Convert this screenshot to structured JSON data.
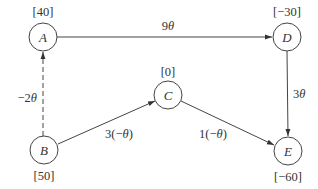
{
  "diagram": {
    "type": "directed-graph",
    "colors": {
      "stroke": "#444444",
      "text": "#333333",
      "background": "#ffffff"
    },
    "nodes": [
      {
        "id": "A",
        "label": "A",
        "value": "[40]",
        "cx": 43,
        "cy": 37,
        "value_pos": "above"
      },
      {
        "id": "D",
        "label": "D",
        "value": "[−30]",
        "cx": 287,
        "cy": 37,
        "value_pos": "above"
      },
      {
        "id": "C",
        "label": "C",
        "value": "[0]",
        "cx": 168,
        "cy": 95,
        "value_pos": "above"
      },
      {
        "id": "B",
        "label": "B",
        "value": "[50]",
        "cx": 44,
        "cy": 150,
        "value_pos": "below"
      },
      {
        "id": "E",
        "label": "E",
        "value": "[−60]",
        "cx": 288,
        "cy": 151,
        "value_pos": "below"
      }
    ],
    "edges": [
      {
        "from": "A",
        "to": "D",
        "label_coef": "9",
        "label_var": "θ",
        "style": "solid"
      },
      {
        "from": "D",
        "to": "E",
        "label_coef": "3",
        "label_var": "θ",
        "style": "solid"
      },
      {
        "from": "B",
        "to": "A",
        "label_coef": "−2",
        "label_var": "θ",
        "style": "dashed"
      },
      {
        "from": "B",
        "to": "C",
        "label_pre": "3(−",
        "label_var": "θ",
        "label_post": ")",
        "style": "solid"
      },
      {
        "from": "C",
        "to": "E",
        "label_pre": "1(−",
        "label_var": "θ",
        "label_post": ")",
        "style": "solid"
      }
    ]
  }
}
